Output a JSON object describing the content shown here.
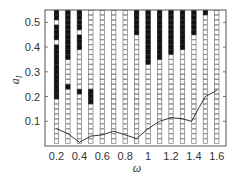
{
  "chart_data": {
    "type": "scatter",
    "title": "",
    "xlabel": "ω",
    "ylabel": "a",
    "ylabel_subscript": "I",
    "xlim": [
      0.1,
      1.68
    ],
    "ylim": [
      0.0,
      0.55
    ],
    "x_ticks": [
      0.2,
      0.4,
      0.6,
      0.8,
      1,
      1.2,
      1.4,
      1.6
    ],
    "x_tick_labels": [
      "0.2",
      "0.4",
      "0.6",
      "0.8",
      "1",
      "1.2",
      "1.4",
      "1.6"
    ],
    "y_ticks": [
      0.1,
      0.2,
      0.3,
      0.4,
      0.5
    ],
    "y_tick_labels": [
      "0.1",
      "0.2",
      "0.3",
      "0.4",
      "0.5"
    ],
    "grid": false,
    "legend": [],
    "marker_legend": {
      "filled": "filled square",
      "empty": "open square"
    },
    "columns_omega": [
      0.2,
      0.3,
      0.4,
      0.5,
      0.6,
      0.7,
      0.8,
      0.9,
      1.0,
      1.1,
      1.2,
      1.3,
      1.4,
      1.5,
      1.6
    ],
    "a_values": [
      0.02,
      0.04,
      0.06,
      0.08,
      0.1,
      0.12,
      0.14,
      0.16,
      0.18,
      0.2,
      0.22,
      0.24,
      0.26,
      0.28,
      0.3,
      0.32,
      0.34,
      0.36,
      0.38,
      0.4,
      0.42,
      0.44,
      0.46,
      0.48,
      0.5,
      0.52,
      0.54
    ],
    "filled_pattern_bottom_to_top": [
      "000000000111111111110111011111",
      "000000000001000001111111111111",
      "000000000010000000011101111111",
      "000000001110000000000000000000",
      "000000000000000000000000000000",
      "000000000000000000000000000000",
      "000000000000000000000000000000",
      "000000000000000000000011111111",
      "000000000000000011111111111111",
      "000000000000000001111111111111",
      "000000000000000000111111111111",
      "000000000000000000011111111111",
      "000000000000000000000011111111",
      "000000000000000000000000001111",
      "000000000000000000000000000011"
    ],
    "curve": {
      "name": "threshold curve",
      "x": [
        0.2,
        0.3,
        0.4,
        0.5,
        0.6,
        0.7,
        0.8,
        0.9,
        1.0,
        1.1,
        1.2,
        1.3,
        1.38,
        1.45,
        1.5,
        1.6
      ],
      "y": [
        0.07,
        0.05,
        0.015,
        0.04,
        0.045,
        0.06,
        0.045,
        0.03,
        0.07,
        0.1,
        0.115,
        0.11,
        0.1,
        0.16,
        0.2,
        0.225
      ]
    }
  }
}
